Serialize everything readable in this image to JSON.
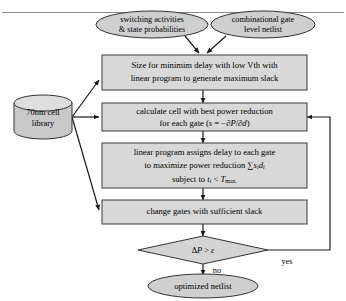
{
  "figure": {
    "colors": {
      "shape_fill": "#cfcfcf",
      "box_fill": "#d8d8d8",
      "diamond_fill": "#d4d4d4",
      "cylinder_fill": "#c9c9c9",
      "stroke": "#333333",
      "edge": "#1a1a1a",
      "frame_line": "#8d8d8d",
      "background": "#ffffff"
    }
  },
  "inputs": [
    {
      "id": "switching",
      "line1": "switching activities",
      "line2": "& state probabilities"
    },
    {
      "id": "netlist",
      "line1": "combinational gate",
      "line2": "level netlist"
    }
  ],
  "library": {
    "line1": "70nm cell",
    "line2": "library"
  },
  "steps": [
    {
      "id": "step-size",
      "line1": "Size for minimim delay with low Vth with",
      "line2": "linear program to generate maximum slack"
    },
    {
      "id": "step-calculate",
      "line1": "calculate cell with best power reduction",
      "line2_pre": "for each gate (",
      "line2_var": "s",
      "line2_mid": " = −∂",
      "line2_p": "P",
      "line2_slash": "/∂",
      "line2_d": "d",
      "line2_post": ")"
    },
    {
      "id": "step-linear-program",
      "line1": "linear program assigns delay to each gate",
      "line2_pre": "to maximize power reduction ",
      "line2_sum": "∑",
      "line2_s": "s",
      "line2_s_sub": "i",
      "line2_d": "d",
      "line2_d_sub": "i",
      "line3_pre": "subject to ",
      "line3_t": "t",
      "line3_t_sub": "i",
      "line3_op": " < ",
      "line3_T": "T",
      "line3_T_sub": "max."
    },
    {
      "id": "step-change-gates",
      "line1": "change gates with sufficient slack"
    }
  ],
  "decision": {
    "id": "decision-delta-p",
    "delta": "Δ",
    "p": "P",
    "op": " > ",
    "epsilon": "ε"
  },
  "edge_labels": {
    "yes": "yes",
    "no": "no"
  },
  "output": {
    "id": "optimized-netlist",
    "label": "optimized netlist"
  }
}
